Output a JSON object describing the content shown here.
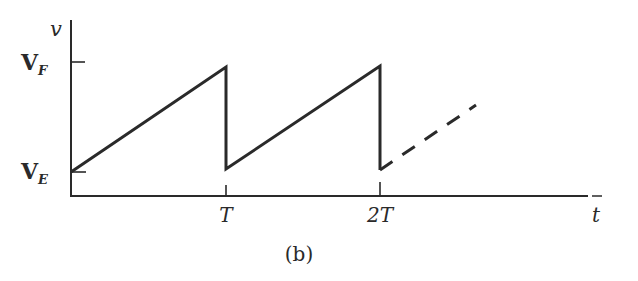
{
  "figure": {
    "caption": "(b)",
    "y_axis_label": "v",
    "x_axis_label": "t",
    "y_ticks": [
      {
        "label": "V",
        "sub": "F",
        "meaning": "V_F"
      },
      {
        "label": "V",
        "sub": "E",
        "meaning": "V_E"
      }
    ],
    "x_ticks": [
      {
        "label": "T"
      },
      {
        "label": "2T"
      }
    ],
    "waveform": "sawtooth",
    "continuation": "dashed ramp after 2T"
  },
  "colors": {
    "ink": "#2a2a2a",
    "background": "#ffffff"
  }
}
